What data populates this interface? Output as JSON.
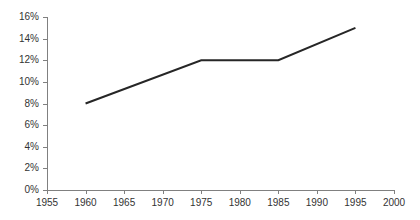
{
  "chart_data": {
    "type": "line",
    "title": "",
    "subtitle": "",
    "xlabel": "",
    "ylabel": "",
    "x": [
      1960,
      1975,
      1985,
      1995
    ],
    "values": [
      8,
      12,
      12,
      15
    ],
    "series": [
      {
        "name": "",
        "x": [
          1960,
          1975,
          1985,
          1995
        ],
        "values": [
          8,
          12,
          12,
          15
        ]
      }
    ],
    "xlim": [
      1955,
      2000
    ],
    "ylim": [
      0,
      16
    ],
    "x_ticks": [
      1955,
      1960,
      1965,
      1970,
      1975,
      1980,
      1985,
      1990,
      1995,
      2000
    ],
    "x_tick_labels": [
      "1955",
      "1960",
      "1965",
      "1970",
      "1975",
      "1980",
      "1985",
      "1990",
      "1995",
      "2000"
    ],
    "y_ticks": [
      0,
      2,
      4,
      6,
      8,
      10,
      12,
      14,
      16
    ],
    "y_tick_labels": [
      "0%",
      "2%",
      "4%",
      "6%",
      "8%",
      "10%",
      "12%",
      "14%",
      "16%"
    ],
    "grid": false,
    "legend": false,
    "legend_position": "none",
    "markers": false,
    "annotations": [],
    "colors": {
      "line": "#262626",
      "axis": "#808080",
      "tick_text": "#333333",
      "background": "#ffffff"
    }
  }
}
